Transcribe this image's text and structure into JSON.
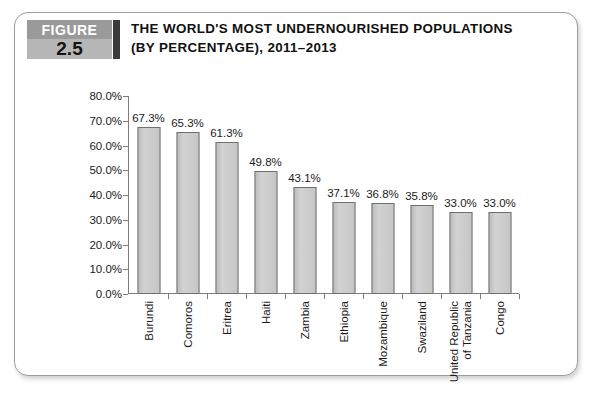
{
  "figure": {
    "badge_word": "FIGURE",
    "badge_number": "2.5",
    "title_line1": "THE WORLD'S MOST UNDERNOURISHED POPULATIONS",
    "title_line2": "(BY PERCENTAGE), 2011–2013"
  },
  "colors": {
    "bar_fill": "#c9c9c9",
    "bar_border": "#6f6f6f",
    "axis": "#7d7d7d",
    "badge_gray_top": "#9a9a9a",
    "badge_gray_bottom": "#b6b6b6",
    "badge_bar": "#3b3b3b",
    "text": "#111111",
    "card_border": "#9e9e9e"
  },
  "chart_data": {
    "type": "bar",
    "title": "THE WORLD'S MOST UNDERNOURISHED POPULATIONS (BY PERCENTAGE), 2011–2013",
    "xlabel": "",
    "ylabel": "",
    "ylim": [
      0,
      80
    ],
    "grid": false,
    "legend": "none",
    "orientation": "vertical",
    "categories": [
      "Burundi",
      "Comoros",
      "Eritrea",
      "Haiti",
      "Zambia",
      "Ethiopia",
      "Mozambique",
      "Swaziland",
      "United Republic of Tanzania",
      "Congo"
    ],
    "category_lines": [
      [
        "Burundi"
      ],
      [
        "Comoros"
      ],
      [
        "Eritrea"
      ],
      [
        "Haiti"
      ],
      [
        "Zambia"
      ],
      [
        "Ethiopia"
      ],
      [
        "Mozambique"
      ],
      [
        "Swaziland"
      ],
      [
        "United Republic",
        "of Tanzania"
      ],
      [
        "Congo"
      ]
    ],
    "values": [
      67.3,
      65.3,
      61.3,
      49.8,
      43.1,
      37.1,
      36.8,
      35.8,
      33.0,
      33.0
    ],
    "value_labels": [
      "67.3%",
      "65.3%",
      "61.3%",
      "49.8%",
      "43.1%",
      "37.1%",
      "36.8%",
      "35.8%",
      "33.0%",
      "33.0%"
    ],
    "ytick_values": [
      80,
      70,
      60,
      50,
      40,
      30,
      20,
      10,
      0
    ],
    "ytick_labels": [
      "80.0%",
      "70.0%",
      "60.0%",
      "50.0%",
      "40.0%",
      "30.0%",
      "20.0%",
      "10.0%",
      "0.0%"
    ]
  }
}
